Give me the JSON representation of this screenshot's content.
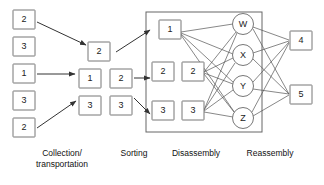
{
  "diagram": {
    "stage_labels": [
      {
        "id": "collection",
        "line1": "Collection/",
        "line2": "transportation",
        "x": 62,
        "y": 156
      },
      {
        "id": "sorting",
        "line1": "Sorting",
        "line2": "",
        "x": 134,
        "y": 156
      },
      {
        "id": "disassembly",
        "line1": "Disassembly",
        "line2": "",
        "x": 196,
        "y": 156
      },
      {
        "id": "reassembly",
        "line1": "Reassembly",
        "line2": "",
        "x": 270,
        "y": 156
      }
    ],
    "collection_boxes": [
      {
        "id": "collection-box-1",
        "label": "2",
        "x": 13,
        "y": 10,
        "w": 22,
        "h": 19
      },
      {
        "id": "collection-box-2",
        "label": "3",
        "x": 13,
        "y": 37,
        "w": 22,
        "h": 19
      },
      {
        "id": "collection-box-3",
        "label": "1",
        "x": 13,
        "y": 64,
        "w": 22,
        "h": 19
      },
      {
        "id": "collection-box-4",
        "label": "3",
        "x": 13,
        "y": 91,
        "w": 22,
        "h": 19
      },
      {
        "id": "collection-box-5",
        "label": "2",
        "x": 13,
        "y": 118,
        "w": 22,
        "h": 19
      }
    ],
    "sorting_boxes": [
      {
        "id": "sorting-box-top",
        "label": "2",
        "x": 88,
        "y": 42,
        "w": 22,
        "h": 19
      },
      {
        "id": "sorting-box-mid-left",
        "label": "1",
        "x": 79,
        "y": 69,
        "w": 22,
        "h": 19
      },
      {
        "id": "sorting-box-mid-right",
        "label": "2",
        "x": 110,
        "y": 69,
        "w": 22,
        "h": 19
      },
      {
        "id": "sorting-box-bot-left",
        "label": "3",
        "x": 79,
        "y": 96,
        "w": 22,
        "h": 19
      },
      {
        "id": "sorting-box-bot-right",
        "label": "3",
        "x": 110,
        "y": 96,
        "w": 22,
        "h": 19
      }
    ],
    "disassembly_group": {
      "id": "disassembly-group",
      "x": 146,
      "y": 12,
      "w": 116,
      "h": 120
    },
    "disassembly_boxes": [
      {
        "id": "disassembly-box-1",
        "label": "1",
        "x": 159,
        "y": 20,
        "w": 22,
        "h": 19
      },
      {
        "id": "disassembly-box-2a",
        "label": "2",
        "x": 152,
        "y": 62,
        "w": 22,
        "h": 19
      },
      {
        "id": "disassembly-box-2b",
        "label": "2",
        "x": 182,
        "y": 62,
        "w": 22,
        "h": 19
      },
      {
        "id": "disassembly-box-3a",
        "label": "3",
        "x": 152,
        "y": 101,
        "w": 22,
        "h": 19
      },
      {
        "id": "disassembly-box-3b",
        "label": "3",
        "x": 182,
        "y": 101,
        "w": 22,
        "h": 19
      }
    ],
    "component_circles": [
      {
        "id": "component-circle-w",
        "label": "W",
        "cx": 243,
        "cy": 24,
        "r": 10.5
      },
      {
        "id": "component-circle-x",
        "label": "X",
        "cx": 243,
        "cy": 55,
        "r": 10.5
      },
      {
        "id": "component-circle-y",
        "label": "Y",
        "cx": 243,
        "cy": 86,
        "r": 10.5
      },
      {
        "id": "component-circle-z",
        "label": "Z",
        "cx": 243,
        "cy": 118,
        "r": 10.5
      }
    ],
    "reassembly_boxes": [
      {
        "id": "reassembly-box-4",
        "label": "4",
        "x": 290,
        "y": 31,
        "w": 22,
        "h": 19
      },
      {
        "id": "reassembly-box-5",
        "label": "5",
        "x": 290,
        "y": 85,
        "w": 22,
        "h": 19
      }
    ],
    "arrows": [
      {
        "id": "arrow-collection-top",
        "x1": 37,
        "y1": 22,
        "x2": 86,
        "y2": 45
      },
      {
        "id": "arrow-collection-mid",
        "x1": 37,
        "y1": 74,
        "x2": 75,
        "y2": 74
      },
      {
        "id": "arrow-collection-bot",
        "x1": 37,
        "y1": 128,
        "x2": 76,
        "y2": 101
      },
      {
        "id": "arrow-sorting-top",
        "x1": 116,
        "y1": 52,
        "x2": 150,
        "y2": 30
      },
      {
        "id": "arrow-sorting-mid",
        "x1": 134,
        "y1": 78,
        "x2": 150,
        "y2": 78
      },
      {
        "id": "arrow-sorting-bot",
        "x1": 134,
        "y1": 98,
        "x2": 150,
        "y2": 114
      }
    ],
    "edges_box_to_circle": [
      {
        "from": "disassembly-box-1",
        "to": "component-circle-w",
        "x1": 181,
        "y1": 32,
        "x2": 233,
        "y2": 24
      },
      {
        "from": "disassembly-box-1",
        "to": "component-circle-x",
        "x1": 181,
        "y1": 33,
        "x2": 233,
        "y2": 54
      },
      {
        "from": "disassembly-box-1",
        "to": "component-circle-y",
        "x1": 181,
        "y1": 34,
        "x2": 234,
        "y2": 83
      },
      {
        "from": "disassembly-box-1",
        "to": "component-circle-z",
        "x1": 181,
        "y1": 35,
        "x2": 235,
        "y2": 113
      },
      {
        "from": "disassembly-box-2b",
        "to": "component-circle-w",
        "x1": 204,
        "y1": 72,
        "x2": 236,
        "y2": 32
      },
      {
        "from": "disassembly-box-2b",
        "to": "component-circle-x",
        "x1": 204,
        "y1": 72,
        "x2": 233,
        "y2": 58
      },
      {
        "from": "disassembly-box-2b",
        "to": "component-circle-y",
        "x1": 204,
        "y1": 73,
        "x2": 233,
        "y2": 84
      },
      {
        "from": "disassembly-box-2b",
        "to": "component-circle-z",
        "x1": 204,
        "y1": 74,
        "x2": 234,
        "y2": 112
      },
      {
        "from": "disassembly-box-3b",
        "to": "component-circle-w",
        "x1": 204,
        "y1": 110,
        "x2": 237,
        "y2": 33
      },
      {
        "from": "disassembly-box-3b",
        "to": "component-circle-x",
        "x1": 204,
        "y1": 110,
        "x2": 235,
        "y2": 63
      },
      {
        "from": "disassembly-box-3b",
        "to": "component-circle-y",
        "x1": 204,
        "y1": 111,
        "x2": 233,
        "y2": 90
      },
      {
        "from": "disassembly-box-3b",
        "to": "component-circle-z",
        "x1": 204,
        "y1": 112,
        "x2": 233,
        "y2": 117
      }
    ],
    "edges_circle_to_box": [
      {
        "from": "component-circle-w",
        "to": "reassembly-box-4",
        "x1": 253,
        "y1": 27,
        "x2": 289,
        "y2": 40
      },
      {
        "from": "component-circle-w",
        "to": "reassembly-box-5",
        "x1": 253,
        "y1": 29,
        "x2": 289,
        "y2": 94
      },
      {
        "from": "component-circle-x",
        "to": "reassembly-box-4",
        "x1": 253,
        "y1": 53,
        "x2": 289,
        "y2": 41
      },
      {
        "from": "component-circle-x",
        "to": "reassembly-box-5",
        "x1": 253,
        "y1": 59,
        "x2": 289,
        "y2": 94
      },
      {
        "from": "component-circle-y",
        "to": "reassembly-box-4",
        "x1": 253,
        "y1": 82,
        "x2": 289,
        "y2": 42
      },
      {
        "from": "component-circle-y",
        "to": "reassembly-box-5",
        "x1": 253,
        "y1": 89,
        "x2": 289,
        "y2": 94
      },
      {
        "from": "component-circle-z",
        "to": "reassembly-box-4",
        "x1": 252,
        "y1": 112,
        "x2": 289,
        "y2": 43
      },
      {
        "from": "component-circle-z",
        "to": "reassembly-box-5",
        "x1": 253,
        "y1": 116,
        "x2": 289,
        "y2": 95
      }
    ],
    "colors": {
      "box_stroke": "#777777",
      "group_stroke": "#666666",
      "edge_stroke": "#555555",
      "arrow_stroke": "#333333",
      "text": "#222222",
      "background": "#ffffff"
    }
  }
}
